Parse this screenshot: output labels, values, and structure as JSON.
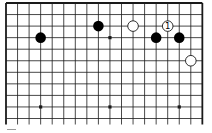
{
  "diagram": {
    "type": "go-board-fragment",
    "board_size": 19,
    "visible_columns": 18,
    "visible_rows": 11,
    "edges_shown": [
      "top",
      "left",
      "right"
    ],
    "hoshi": [
      [
        3,
        3
      ],
      [
        9,
        3
      ],
      [
        15,
        3
      ],
      [
        3,
        9
      ],
      [
        9,
        9
      ],
      [
        15,
        9
      ]
    ],
    "stones": [
      {
        "color": "black",
        "col": 3,
        "row": 3,
        "label": ""
      },
      {
        "color": "black",
        "col": 8,
        "row": 2,
        "label": ""
      },
      {
        "color": "white",
        "col": 11,
        "row": 2,
        "label": ""
      },
      {
        "color": "white",
        "col": 14,
        "row": 2,
        "label": "1"
      },
      {
        "color": "black",
        "col": 13,
        "row": 3,
        "label": ""
      },
      {
        "color": "black",
        "col": 15,
        "row": 3,
        "label": ""
      },
      {
        "color": "white",
        "col": 16,
        "row": 5,
        "label": ""
      }
    ],
    "colors": {
      "line": "#1a1a1a",
      "black_stone": "#000000",
      "white_stone": "#ffffff",
      "background": "#ffffff"
    }
  }
}
